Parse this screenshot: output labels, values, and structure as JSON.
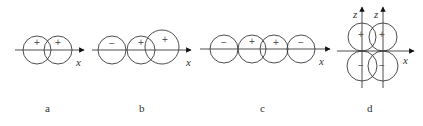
{
  "diagram": {
    "stroke_color": "#3a3a3a",
    "panels": [
      {
        "id": "a",
        "label": "a",
        "label_pos": [
          45,
          103
        ],
        "axis": {
          "x1": 15,
          "x2": 84,
          "y": 50,
          "label": "x",
          "label_pos": [
            76,
            57
          ]
        },
        "circles": [
          {
            "cx": 37,
            "cy": 50,
            "r": 14,
            "sign": "+",
            "sign_pos": [
              37,
              43
            ]
          },
          {
            "cx": 58,
            "cy": 50,
            "r": 14,
            "sign": "+",
            "sign_pos": [
              58,
              43
            ]
          }
        ]
      },
      {
        "id": "b",
        "label": "b",
        "label_pos": [
          139,
          103
        ],
        "axis": {
          "x1": 92,
          "x2": 191,
          "y": 50,
          "label": "x",
          "label_pos": [
            186,
            57
          ]
        },
        "circles": [
          {
            "cx": 112,
            "cy": 50,
            "r": 14,
            "sign": "−",
            "sign_pos": [
              112,
              44
            ]
          },
          {
            "cx": 141,
            "cy": 50,
            "r": 14,
            "sign": "+",
            "sign_pos": [
              141,
              43
            ]
          },
          {
            "cx": 162,
            "cy": 47,
            "r": 17,
            "sign": "+",
            "sign_pos": [
              165,
              40
            ]
          }
        ]
      },
      {
        "id": "c",
        "label": "c",
        "label_pos": [
          260,
          103
        ],
        "axis": {
          "x1": 200,
          "x2": 330,
          "y": 49,
          "label": "x",
          "label_pos": [
            319,
            56
          ]
        },
        "circles": [
          {
            "cx": 224,
            "cy": 49,
            "r": 14,
            "sign": "−",
            "sign_pos": [
              224,
              43
            ]
          },
          {
            "cx": 252,
            "cy": 49,
            "r": 14,
            "sign": "+",
            "sign_pos": [
              252,
              42
            ]
          },
          {
            "cx": 274,
            "cy": 49,
            "r": 14,
            "sign": "+",
            "sign_pos": [
              276,
              43
            ]
          },
          {
            "cx": 301,
            "cy": 49,
            "r": 14,
            "sign": "−",
            "sign_pos": [
              301,
              43
            ]
          }
        ]
      },
      {
        "id": "d",
        "label": "d",
        "label_pos": [
          367,
          103
        ],
        "axis": {
          "x1": 337,
          "x2": 414,
          "y": 51,
          "label": "x",
          "label_pos": [
            403,
            55
          ]
        },
        "z_axes": [
          {
            "x": 362,
            "y1": 88,
            "y2": 7,
            "label": "z",
            "label_pos": [
              353,
              9
            ]
          },
          {
            "x": 383,
            "y1": 88,
            "y2": 7,
            "label": "z",
            "label_pos": [
              374,
              9
            ]
          }
        ],
        "circles": [
          {
            "cx": 362,
            "cy": 37,
            "r": 14,
            "sign": "+",
            "sign_pos": [
              361,
              35
            ]
          },
          {
            "cx": 383,
            "cy": 37,
            "r": 14,
            "sign": "+",
            "sign_pos": [
              382,
              35
            ]
          },
          {
            "cx": 362,
            "cy": 66,
            "r": 15,
            "sign": "−",
            "sign_pos": [
              361,
              66
            ]
          },
          {
            "cx": 383,
            "cy": 66,
            "r": 15,
            "sign": "−",
            "sign_pos": [
              382,
              66
            ]
          }
        ]
      }
    ]
  }
}
